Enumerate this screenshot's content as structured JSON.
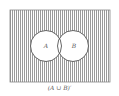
{
  "diagram": {
    "type": "venn",
    "universe": {
      "shaded": true,
      "hatch": "vertical-lines"
    },
    "sets": [
      {
        "label": "A",
        "shaded": false
      },
      {
        "label": "B",
        "shaded": false
      }
    ],
    "caption": "(A ∪ B)′",
    "colors": {
      "stroke": "#666666",
      "hatch": "#9a9a9a",
      "background": "#ffffff"
    }
  }
}
